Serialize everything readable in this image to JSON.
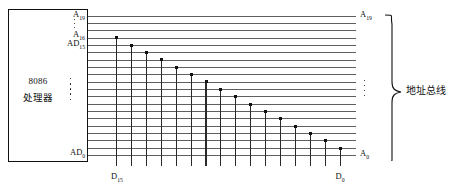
{
  "diagram": {
    "cpu": {
      "name": "8086",
      "name_cn": "处理器",
      "ellipsis_dots": 5,
      "pins_left_top": [
        {
          "base": "A",
          "sub": "19"
        },
        {
          "base": "A",
          "sub": "16"
        },
        {
          "base": "AD",
          "sub": "15"
        }
      ],
      "pin_left_bottom": {
        "base": "AD",
        "sub": "0"
      },
      "pin_ellipsis_dots": 3
    },
    "bus": {
      "label_cn": "地址总线",
      "line_count": 20,
      "top_pin": {
        "base": "A",
        "sub": "19"
      },
      "bottom_pin": {
        "base": "A",
        "sub": "0"
      },
      "ellipsis_dots": 4
    },
    "data_lines": {
      "count": 16,
      "left_label": {
        "base": "D",
        "sub": "15"
      },
      "right_label": {
        "base": "D",
        "sub": "0"
      }
    },
    "colors": {
      "ink": "#111111",
      "bus_line": "#5f5f5f",
      "data_line": "#2a2a2a",
      "background": "#ffffff"
    }
  }
}
